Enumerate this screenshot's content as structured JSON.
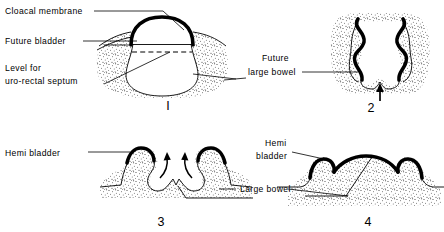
{
  "figure": {
    "background_color": "#ffffff",
    "ink_color": "#000000",
    "panels": [
      {
        "id": "panel-1",
        "number": "I",
        "number_position": {
          "x": 168,
          "y": 110
        },
        "labels": [
          {
            "name": "cloacal-membrane",
            "lines": [
              "Cloacal membrane"
            ],
            "x": 5,
            "y": 14
          },
          {
            "name": "future-bladder",
            "lines": [
              "Future bladder"
            ],
            "x": 5,
            "y": 44
          },
          {
            "name": "level-for-uro-rectal-septum",
            "lines": [
              "Level for",
              "uro-rectal septum"
            ],
            "x": 5,
            "y": 71
          }
        ]
      },
      {
        "id": "panel-2",
        "number": "2",
        "number_position": {
          "x": 371,
          "y": 112
        },
        "labels": [
          {
            "name": "future-large-bowel",
            "lines": [
              "Future",
              "large bowel"
            ],
            "x": 250,
            "y": 61
          }
        ]
      },
      {
        "id": "panel-3",
        "number": "3",
        "number_position": {
          "x": 161,
          "y": 226
        },
        "labels": [
          {
            "name": "hemi-bladder-left",
            "lines": [
              "Hemi bladder"
            ],
            "x": 5,
            "y": 156
          }
        ]
      },
      {
        "id": "panel-4",
        "number": "4",
        "number_position": {
          "x": 368,
          "y": 226
        },
        "labels": [
          {
            "name": "hemi-bladder-right",
            "lines": [
              "Hemi",
              "bladder"
            ],
            "x": 252,
            "y": 146
          },
          {
            "name": "large-bowel",
            "lines": [
              "Large bowel"
            ],
            "x": 240,
            "y": 192
          }
        ]
      }
    ]
  }
}
